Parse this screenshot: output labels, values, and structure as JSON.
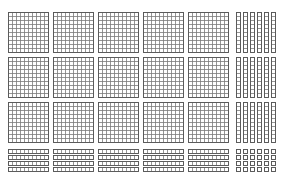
{
  "diagram": {
    "colors": {
      "background": "#ffffff",
      "line": "#7a7a7a",
      "edge": "#555555"
    },
    "hundred_flats": {
      "rows": 3,
      "per_row": 5,
      "grid": 10
    },
    "ten_rods_vertical": {
      "rows": 3,
      "per_row": 6
    },
    "ten_rods_horizontal": {
      "columns": 5,
      "per_column": 4
    },
    "unit_cubes": {
      "columns": 6,
      "rows": 4
    },
    "value_summary": {
      "hundreds": 15,
      "tens": 38,
      "ones": 24,
      "total": 1904
    }
  }
}
